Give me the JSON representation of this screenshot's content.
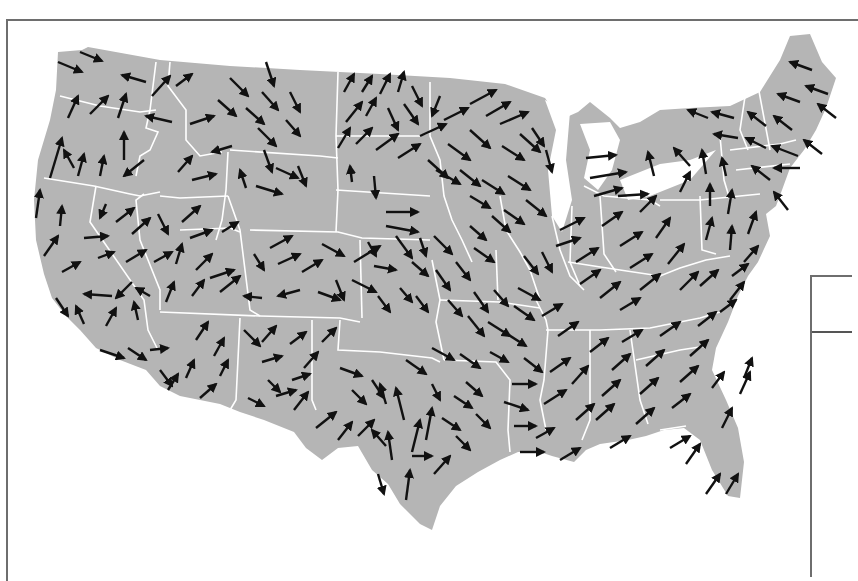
{
  "map": {
    "type": "vector-field",
    "region": "contiguous-united-states",
    "land_color": "#b5b5b5",
    "border_color": "#ffffff",
    "arrow_color": "#111111",
    "frame_color": "#6e6e6e"
  },
  "legend": {
    "visible": "partial",
    "text": ""
  }
}
